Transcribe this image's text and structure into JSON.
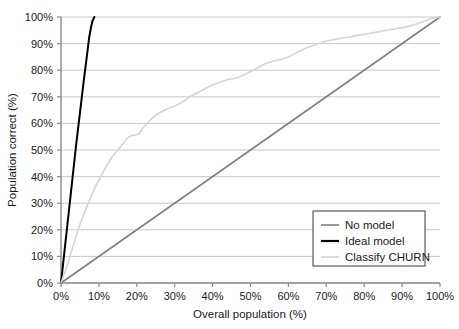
{
  "chart_data": {
    "type": "line",
    "title": "",
    "xlabel": "Overall population (%)",
    "ylabel": "Population correct (%)",
    "xlim": [
      0,
      100
    ],
    "ylim": [
      0,
      100
    ],
    "xticks": [
      "0%",
      "10%",
      "20%",
      "30%",
      "40%",
      "50%",
      "60%",
      "70%",
      "80%",
      "90%",
      "100%"
    ],
    "yticks": [
      "0%",
      "10%",
      "20%",
      "30%",
      "40%",
      "50%",
      "60%",
      "70%",
      "80%",
      "90%",
      "100%"
    ],
    "xtick_values": [
      0,
      10,
      20,
      30,
      40,
      50,
      60,
      70,
      80,
      90,
      100
    ],
    "ytick_values": [
      0,
      10,
      20,
      30,
      40,
      50,
      60,
      70,
      80,
      90,
      100
    ],
    "grid": "horizontal",
    "legend_position": "lower-right",
    "series": [
      {
        "name": "No model",
        "color": "#808080",
        "width": 1.6,
        "points": [
          [
            0,
            0
          ],
          [
            100,
            100
          ]
        ]
      },
      {
        "name": "Ideal model",
        "color": "#000000",
        "width": 2.0,
        "points": [
          [
            0,
            0
          ],
          [
            1.0,
            13
          ],
          [
            2.0,
            26
          ],
          [
            3.0,
            39
          ],
          [
            4.0,
            52
          ],
          [
            5.0,
            64
          ],
          [
            6.0,
            76
          ],
          [
            6.8,
            85
          ],
          [
            7.4,
            92
          ],
          [
            7.9,
            96
          ],
          [
            8.3,
            98.5
          ],
          [
            8.8,
            100
          ]
        ]
      },
      {
        "name": "Classify CHURN",
        "color": "#d4d4d4",
        "width": 1.6,
        "points": [
          [
            0,
            0
          ],
          [
            1.5,
            6
          ],
          [
            3,
            13
          ],
          [
            4.5,
            20
          ],
          [
            6,
            26
          ],
          [
            7.5,
            31
          ],
          [
            9,
            36
          ],
          [
            10.5,
            40
          ],
          [
            12,
            44
          ],
          [
            13.5,
            47.5
          ],
          [
            15,
            50
          ],
          [
            16.5,
            52.5
          ],
          [
            17.5,
            54.5
          ],
          [
            18.5,
            55.5
          ],
          [
            19.5,
            55.5
          ],
          [
            20.5,
            56
          ],
          [
            21.5,
            58
          ],
          [
            23,
            60.5
          ],
          [
            24.5,
            62.5
          ],
          [
            26,
            64
          ],
          [
            28,
            65.5
          ],
          [
            30,
            66.5
          ],
          [
            32,
            68
          ],
          [
            34,
            70
          ],
          [
            36,
            71.5
          ],
          [
            38,
            73
          ],
          [
            40,
            74.5
          ],
          [
            42,
            75.5
          ],
          [
            44,
            76.5
          ],
          [
            46,
            77
          ],
          [
            48,
            78
          ],
          [
            50,
            79.5
          ],
          [
            52,
            81
          ],
          [
            54,
            82.5
          ],
          [
            56,
            83.5
          ],
          [
            58,
            84
          ],
          [
            60,
            85
          ],
          [
            62,
            86.5
          ],
          [
            64,
            88
          ],
          [
            66,
            89
          ],
          [
            68,
            90
          ],
          [
            70,
            91
          ],
          [
            72,
            91.5
          ],
          [
            74,
            92
          ],
          [
            76,
            92.5
          ],
          [
            78,
            93
          ],
          [
            80,
            93.5
          ],
          [
            82,
            94
          ],
          [
            84,
            94.5
          ],
          [
            86,
            95
          ],
          [
            88,
            95.5
          ],
          [
            90,
            96
          ],
          [
            92,
            96.5
          ],
          [
            94,
            97.5
          ],
          [
            96,
            98.5
          ],
          [
            98,
            99.5
          ],
          [
            100,
            100
          ]
        ]
      }
    ]
  },
  "legend": {
    "items": [
      {
        "label": "No model",
        "color": "#808080",
        "width": 1.6
      },
      {
        "label": "Ideal model",
        "color": "#000000",
        "width": 2.2
      },
      {
        "label": "Classify CHURN",
        "color": "#d4d4d4",
        "width": 1.6
      }
    ]
  },
  "style": {
    "grid_color": "#c8c8c8",
    "axis_color": "#8c8c8c",
    "text_color": "#1a1a1a",
    "background": "#ffffff",
    "legend_border": "#3a3a3a"
  }
}
